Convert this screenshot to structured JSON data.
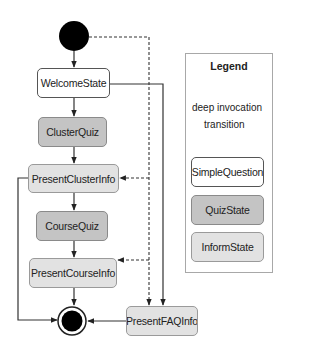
{
  "diagram": {
    "states": {
      "welcome": {
        "label": "WelcomeState",
        "type": "SimpleQuestion"
      },
      "cluster_quiz": {
        "label": "ClusterQuiz",
        "type": "QuizState"
      },
      "present_cluster_info": {
        "label": "PresentClusterInfo",
        "type": "InformState"
      },
      "course_quiz": {
        "label": "CourseQuiz",
        "type": "QuizState"
      },
      "present_course_info": {
        "label": "PresentCourseInfo",
        "type": "InformState"
      },
      "present_faq_info": {
        "label": "PresentFAQInfo",
        "type": "InformState"
      }
    },
    "edges": [
      {
        "from": "initial",
        "to": "welcome",
        "kind": "transition"
      },
      {
        "from": "welcome",
        "to": "cluster_quiz",
        "kind": "transition"
      },
      {
        "from": "cluster_quiz",
        "to": "present_cluster_info",
        "kind": "transition"
      },
      {
        "from": "present_cluster_info",
        "to": "course_quiz",
        "kind": "transition"
      },
      {
        "from": "course_quiz",
        "to": "present_course_info",
        "kind": "transition"
      },
      {
        "from": "present_course_info",
        "to": "final",
        "kind": "transition"
      },
      {
        "from": "present_cluster_info",
        "to": "final",
        "kind": "transition"
      },
      {
        "from": "present_faq_info",
        "to": "final",
        "kind": "transition"
      },
      {
        "from": "welcome",
        "to": "present_faq_info",
        "kind": "transition"
      },
      {
        "from": "initial",
        "to": "present_cluster_info",
        "kind": "deep invocation"
      },
      {
        "from": "initial",
        "to": "present_course_info",
        "kind": "deep invocation"
      },
      {
        "from": "initial",
        "to": "present_faq_info",
        "kind": "deep invocation"
      }
    ]
  },
  "legend": {
    "title": "Legend",
    "deep_invocation": "deep invocation",
    "transition": "transition",
    "simple_question": "SimpleQuestion",
    "quiz_state": "QuizState",
    "inform_state": "InformState"
  },
  "colors": {
    "simple_fill": "#ffffff",
    "quiz_fill": "#c4c4c4",
    "inform_fill": "#e2e2e2",
    "line": "#333333"
  }
}
